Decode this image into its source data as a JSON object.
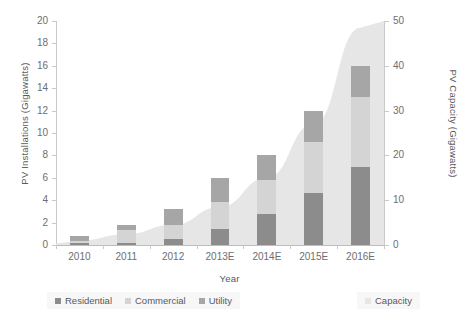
{
  "chart_data": {
    "type": "bar",
    "subtype": "stacked-bar-with-area-overlay",
    "title": "",
    "xlabel": "Year",
    "ylabel": "PV Installations (Gigawatts)",
    "y2label": "PV Capacity (Gigawatts)",
    "categories": [
      "2010",
      "2011",
      "2012",
      "2013E",
      "2014E",
      "2015E",
      "2016E"
    ],
    "ylim": [
      0,
      20
    ],
    "yticks": [
      0,
      2,
      4,
      6,
      8,
      10,
      12,
      14,
      16,
      18,
      20
    ],
    "y2lim": [
      0,
      50
    ],
    "y2ticks": [
      0,
      10,
      20,
      30,
      40,
      50
    ],
    "grid": false,
    "legend_position": "bottom",
    "series": [
      {
        "name": "Residential",
        "axis": "left",
        "color": "#8c8c8c",
        "values": [
          0.15,
          0.2,
          0.5,
          1.4,
          2.8,
          4.6,
          7.0
        ]
      },
      {
        "name": "Commercial",
        "axis": "left",
        "color": "#d4d4d4",
        "values": [
          0.25,
          1.1,
          1.3,
          2.4,
          3.0,
          4.6,
          6.2
        ]
      },
      {
        "name": "Utility",
        "axis": "left",
        "color": "#a6a6a6",
        "values": [
          0.4,
          0.5,
          1.4,
          2.2,
          2.2,
          2.8,
          2.8
        ]
      },
      {
        "name": "Capacity",
        "axis": "right",
        "type": "area",
        "color": "#e6e6e6",
        "values": [
          1.0,
          2.4,
          4.5,
          8.5,
          15.0,
          27.0,
          48.5
        ]
      }
    ],
    "totals_left_axis": [
      0.8,
      1.8,
      3.2,
      6.0,
      8.0,
      12.0,
      16.0
    ]
  },
  "legend": {
    "groups": [
      {
        "name": "installations-legend",
        "items": [
          {
            "label": "Residential",
            "color": "#8c8c8c"
          },
          {
            "label": "Commercial",
            "color": "#d4d4d4"
          },
          {
            "label": "Utility",
            "color": "#a6a6a6"
          }
        ]
      },
      {
        "name": "capacity-legend",
        "items": [
          {
            "label": "Capacity",
            "color": "#e6e6e6"
          }
        ]
      }
    ]
  },
  "colors": {
    "residential": "#8c8c8c",
    "commercial": "#d4d4d4",
    "utility": "#a6a6a6",
    "capacity": "#e6e6e6",
    "axis": "#c9c9c9",
    "text": "#58595b",
    "tick_text": "#6d6e71",
    "background": "#ffffff",
    "legend_background": "#f7f7f7"
  }
}
